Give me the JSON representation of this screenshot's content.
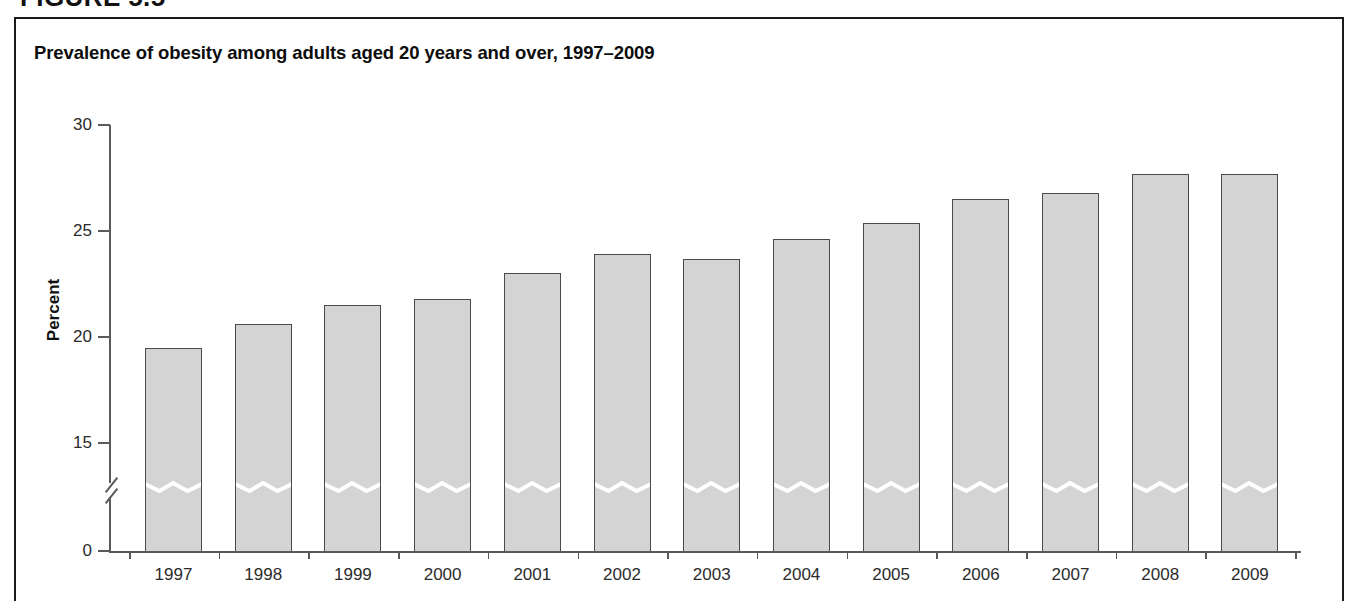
{
  "figure": {
    "heading": "FIGURE 5.5"
  },
  "chart_title": "Prevalence of obesity among adults aged 20 years and over, 1997–2009",
  "chart_data": {
    "type": "bar",
    "title": "Prevalence of obesity among adults aged 20 years and over, 1997–2009",
    "xlabel": "",
    "ylabel": "Percent",
    "categories": [
      "1997",
      "1998",
      "1999",
      "2000",
      "2001",
      "2002",
      "2003",
      "2004",
      "2005",
      "2006",
      "2007",
      "2008",
      "2009"
    ],
    "values": [
      19.5,
      20.6,
      21.5,
      21.8,
      23.0,
      23.9,
      23.7,
      24.6,
      25.4,
      26.5,
      26.8,
      27.7,
      27.7
    ],
    "yticks": [
      0,
      15,
      20,
      25,
      30
    ],
    "ytick_labels": [
      "0",
      "15",
      "20",
      "25",
      "30"
    ],
    "ylim": [
      0,
      30
    ],
    "axis_break": true,
    "axis_break_note": "y-axis broken between 0 and 15; bars carry a white zigzag break mark",
    "grid": false,
    "legend": null,
    "bar_fill": "#d4d4d4",
    "bar_stroke": "#4a4a4a"
  }
}
